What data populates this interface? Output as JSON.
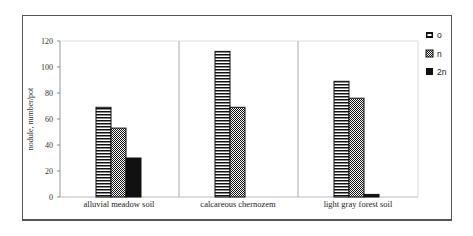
{
  "chart_data": {
    "type": "bar",
    "title": "",
    "xlabel": "",
    "ylabel": "nodule, number/pot",
    "ylim": [
      0,
      120
    ],
    "yticks": [
      0,
      20,
      40,
      60,
      80,
      100,
      120
    ],
    "grid": false,
    "legend_position": "right",
    "categories": [
      "alluvial meadow soil",
      "calcareous chernozem",
      "light gray forest soil"
    ],
    "series": [
      {
        "name": "o",
        "pattern": "horizontal-stripes",
        "values": [
          69,
          112,
          89
        ]
      },
      {
        "name": "n",
        "pattern": "checker",
        "values": [
          53,
          69,
          76
        ]
      },
      {
        "name": "2n",
        "pattern": "solid-black",
        "values": [
          30,
          0,
          2
        ]
      }
    ]
  },
  "axis": {
    "ylabel": "nodule, number/pot",
    "ticks": [
      "0",
      "20",
      "40",
      "60",
      "80",
      "100",
      "120"
    ]
  },
  "categories": [
    "alluvial meadow soil",
    "calcareous chernozem",
    "light gray forest soil"
  ],
  "legend": [
    {
      "label": "o"
    },
    {
      "label": "n"
    },
    {
      "label": "2n"
    }
  ]
}
